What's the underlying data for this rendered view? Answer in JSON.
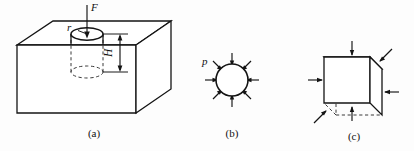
{
  "figure": {
    "background_color": "#fdfdfd",
    "line_color": "#141414",
    "hidden_line_color": "#3a3a3a",
    "panels": [
      {
        "id": "a",
        "caption": "(a)",
        "description": "rectangular block with cylindrical hole",
        "labels": {
          "force": "F",
          "radius": "r",
          "depth": "H"
        }
      },
      {
        "id": "b",
        "caption": "(b)",
        "description": "circle under uniform radial pressure",
        "labels": {
          "pressure": "p"
        },
        "arrow_count": 8
      },
      {
        "id": "c",
        "caption": "(c)",
        "description": "cube under pressure on all faces",
        "labels": {},
        "arrow_count": 6
      }
    ]
  }
}
